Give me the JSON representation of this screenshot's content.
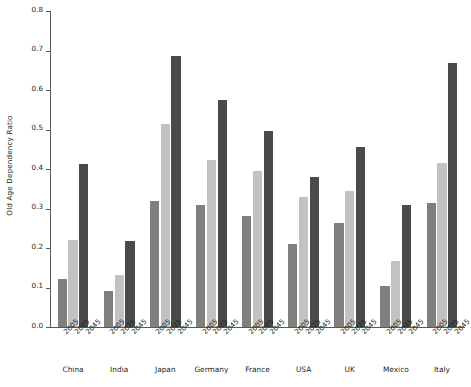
{
  "chart_data": {
    "type": "bar",
    "title": "",
    "subtitle": "",
    "xlabel": "",
    "ylabel": "Old Age Dependency Ratio",
    "ylim": [
      0.0,
      0.8
    ],
    "ytick_labels": [
      "0.0",
      "0.1",
      "0.2",
      "0.3",
      "0.4",
      "0.5",
      "0.6",
      "0.7",
      "0.8"
    ],
    "ytick_values": [
      0.0,
      0.1,
      0.2,
      0.3,
      0.4,
      0.5,
      0.6,
      0.7,
      0.8
    ],
    "grid": false,
    "legend": "none",
    "categories": [
      "China",
      "India",
      "Japan",
      "Germany",
      "France",
      "USA",
      "UK",
      "Mexico",
      "Italy"
    ],
    "group_tick_labels": [
      "2005",
      "2025",
      "2045"
    ],
    "series": [
      {
        "name": "2005",
        "color": "#7f7f7f",
        "values": [
          0.121,
          0.09,
          0.32,
          0.31,
          0.28,
          0.209,
          0.264,
          0.105,
          0.315
        ]
      },
      {
        "name": "2025",
        "color": "#c2c2c2",
        "values": [
          0.22,
          0.131,
          0.515,
          0.424,
          0.396,
          0.328,
          0.345,
          0.167,
          0.415
        ]
      },
      {
        "name": "2045",
        "color": "#4a4a4a",
        "values": [
          0.412,
          0.218,
          0.685,
          0.574,
          0.495,
          0.381,
          0.456,
          0.309,
          0.669
        ]
      }
    ],
    "axis_color": "#58585a",
    "background_color": "#ffffff"
  }
}
